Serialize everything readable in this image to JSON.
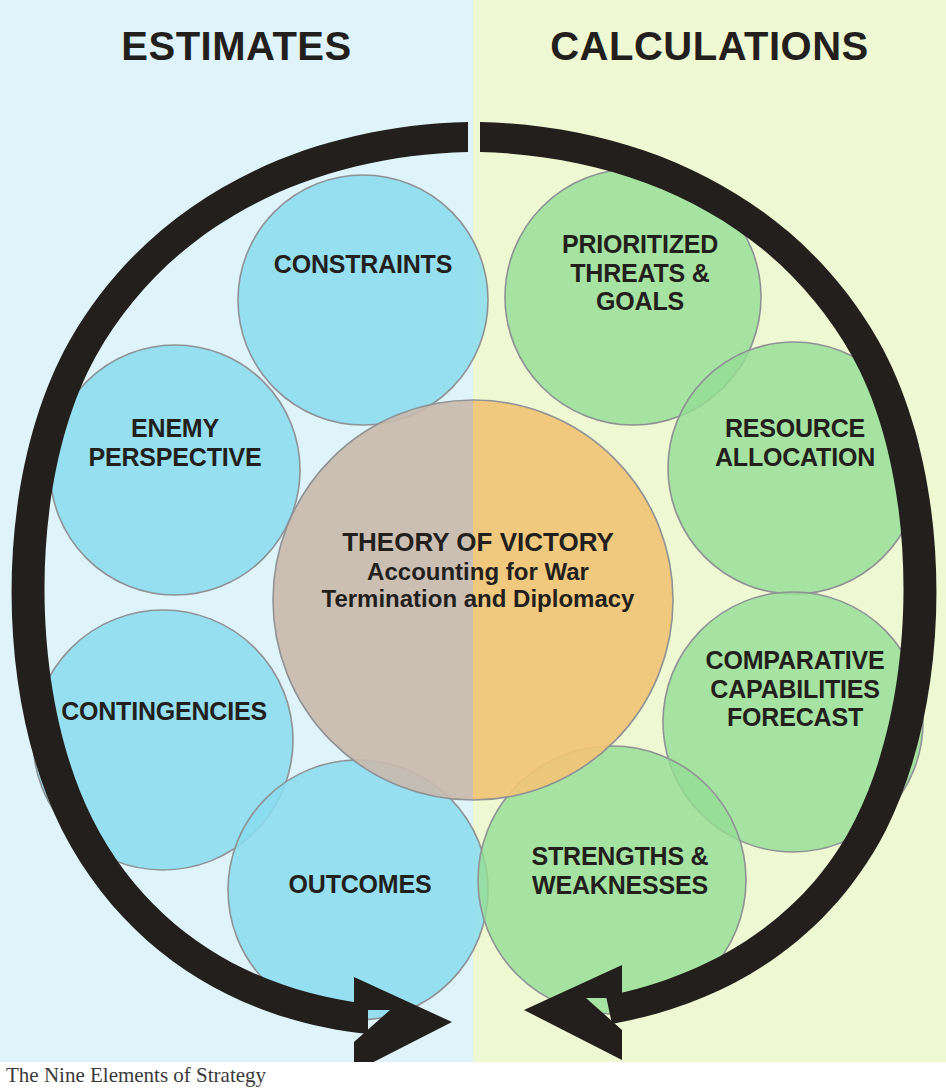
{
  "headers": {
    "left": "ESTIMATES",
    "right": "CALCULATIONS"
  },
  "core": {
    "title": "THEORY OF VICTORY",
    "line2": "Accounting for War",
    "line3": "Termination and Diplomacy"
  },
  "estimates_nodes": [
    {
      "id": "constraints",
      "label": "CONSTRAINTS"
    },
    {
      "id": "enemy",
      "label": "ENEMY\nPERSPECTIVE"
    },
    {
      "id": "contingencies",
      "label": "CONTINGENCIES"
    },
    {
      "id": "outcomes",
      "label": "OUTCOMES"
    }
  ],
  "calculations_nodes": [
    {
      "id": "threats",
      "label": "PRIORITIZED\nTHREATS &\nGOALS"
    },
    {
      "id": "resource",
      "label": "RESOURCE\nALLOCATION"
    },
    {
      "id": "comparative",
      "label": "COMPARATIVE\nCAPABILITIES\nFORECAST"
    },
    {
      "id": "strengths",
      "label": "STRENGTHS &\nWEAKNESSES"
    }
  ],
  "labels": {
    "constraints": "CONSTRAINTS",
    "enemy_l1": "ENEMY",
    "enemy_l2": "PERSPECTIVE",
    "contingencies": "CONTINGENCIES",
    "outcomes": "OUTCOMES",
    "threats_l1": "PRIORITIZED",
    "threats_l2": "THREATS &",
    "threats_l3": "GOALS",
    "resource_l1": "RESOURCE",
    "resource_l2": "ALLOCATION",
    "comparative_l1": "COMPARATIVE",
    "comparative_l2": "CAPABILITIES",
    "comparative_l3": "FORECAST",
    "strengths_l1": "STRENGTHS &",
    "strengths_l2": "WEAKNESSES"
  },
  "caption": "The Nine Elements of Strategy",
  "colors": {
    "bg_left": "#dff4fa",
    "bg_right": "#eef8d2",
    "circle_blue": "#8bdcef",
    "circle_green": "#96dd96",
    "core_left": "#cdbeb3",
    "core_right": "#f0c476",
    "arrow": "#231f1c",
    "outline": "#8f9294",
    "text": "#231f1c"
  },
  "diagram": {
    "type": "venn-cycle",
    "arrow_direction": "two arcs converging at bottom center",
    "node_count": 9
  }
}
